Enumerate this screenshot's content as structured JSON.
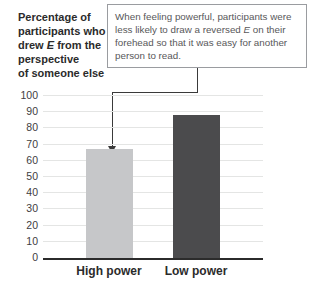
{
  "title": {
    "line1": "Percentage of",
    "line2": "participants who",
    "line3_pre": "drew ",
    "line3_em": "E",
    "line3_post": " from the",
    "line4": "perspective",
    "line5": "of someone else"
  },
  "callout": {
    "line1": "When feeling powerful, participants were",
    "line2_pre": "less likely to draw a reversed ",
    "line2_em": "E",
    "line2_post": " on their",
    "line3": "forehead so that it was easy for another",
    "line4": "person to read."
  },
  "chart_data": {
    "type": "bar",
    "categories": [
      "High power",
      "Low power"
    ],
    "values": [
      67,
      88
    ],
    "title": "Percentage of participants who drew E from the perspective of someone else",
    "annotation": "When feeling powerful, participants were less likely to draw a reversed E on their forehead so that it was easy for another person to read.",
    "xlabel": "",
    "ylabel": "",
    "ylim": [
      0,
      100
    ],
    "yticks": [
      0,
      10,
      20,
      30,
      40,
      50,
      60,
      70,
      80,
      90,
      100
    ],
    "grid": true,
    "legend": "none",
    "bar_colors": [
      "#c6c7c9",
      "#4b4b4d"
    ]
  },
  "colors": {
    "background": "#ffffff",
    "gridline": "#e4e5e4",
    "axis": "#2b2b2b",
    "title_text": "#2b2b2b",
    "callout_text": "#58585a",
    "callout_border": "#9a9ca0",
    "connector": "#3a3a3a",
    "tick_text": "#414042"
  }
}
